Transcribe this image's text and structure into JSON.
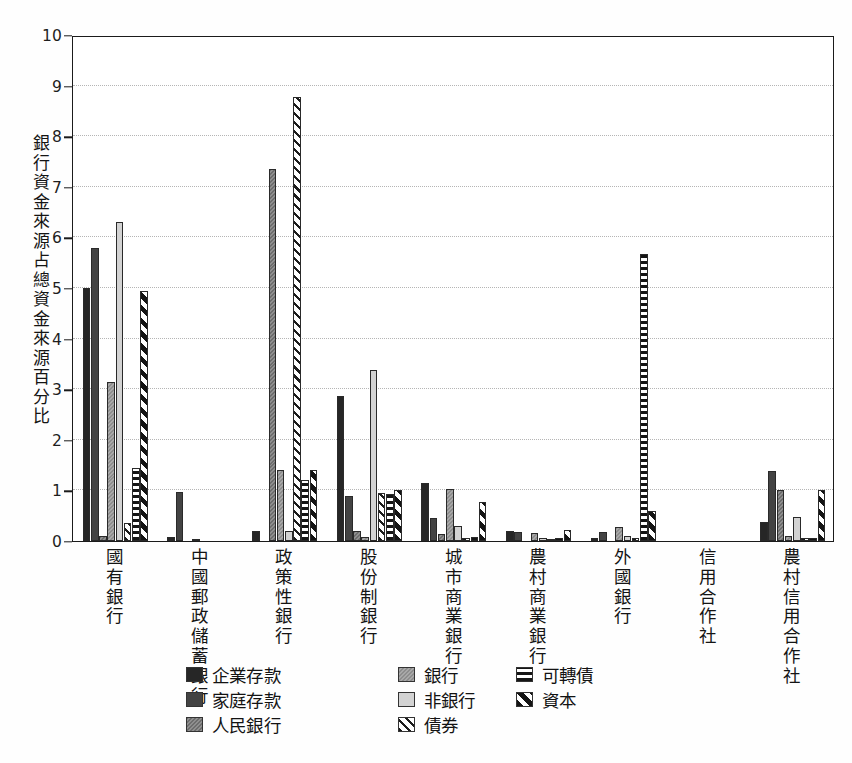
{
  "chart_data": {
    "type": "bar",
    "title": "",
    "xlabel": "",
    "ylabel": "銀行資金來源占總資金來源百分比",
    "ylim": [
      0,
      10
    ],
    "yticks": [
      0,
      1,
      2,
      3,
      4,
      5,
      6,
      7,
      8,
      9,
      10
    ],
    "grid": true,
    "legend_position": "bottom",
    "categories": [
      "國有銀行",
      "中國郵政儲蓄銀行",
      "政策性銀行",
      "股份制銀行",
      "城市商業銀行",
      "農村商業銀行",
      "外國銀行",
      "信用合作社",
      "農村信用合作社"
    ],
    "series": [
      {
        "name": "企業存款",
        "pattern": "solid-black",
        "values": [
          5.0,
          0.08,
          0.2,
          2.87,
          1.15,
          0.2,
          0.05,
          0.0,
          0.38
        ]
      },
      {
        "name": "家庭存款",
        "pattern": "solid-dark",
        "values": [
          5.8,
          0.97,
          0.0,
          0.88,
          0.45,
          0.18,
          0.18,
          0.0,
          1.38
        ]
      },
      {
        "name": "人民銀行",
        "pattern": "dotted-gray",
        "values": [
          0.1,
          0.0,
          7.35,
          0.2,
          0.13,
          0.0,
          0.0,
          0.0,
          1.0
        ]
      },
      {
        "name": "銀行",
        "pattern": "dotted-midgray",
        "values": [
          3.15,
          0.02,
          1.4,
          0.08,
          1.02,
          0.15,
          0.28,
          0.0,
          0.1
        ]
      },
      {
        "name": "非銀行",
        "pattern": "solid-light",
        "values": [
          6.3,
          0.0,
          0.2,
          3.38,
          0.3,
          0.05,
          0.1,
          0.0,
          0.48
        ]
      },
      {
        "name": "債券",
        "pattern": "fine-diagonal",
        "values": [
          0.35,
          0.0,
          8.77,
          0.95,
          0.05,
          0.04,
          0.05,
          0.0,
          0.05
        ]
      },
      {
        "name": "可轉債",
        "pattern": "horizontal",
        "values": [
          1.45,
          0.0,
          1.2,
          0.92,
          0.08,
          0.05,
          5.68,
          0.0,
          0.05
        ]
      },
      {
        "name": "資本",
        "pattern": "bold-diagonal",
        "values": [
          4.95,
          0.0,
          1.4,
          1.0,
          0.78,
          0.22,
          0.6,
          0.0,
          1.0
        ]
      }
    ]
  },
  "legend": {
    "columns": [
      {
        "items": [
          "企業存款",
          "家庭存款",
          "人民銀行"
        ]
      },
      {
        "items": [
          "銀行",
          "非銀行",
          "債券"
        ]
      },
      {
        "items": [
          "可轉債",
          "資本"
        ]
      }
    ]
  },
  "colors": {
    "corp_deposits": "#262626",
    "household_deposits": "#434343",
    "pboc": "#7e7e7e",
    "bank": "#9c9c9c",
    "nonbank": "#d3d3d3",
    "bond": "#1c1c1c",
    "convertible": "#151515",
    "capital": "#141414",
    "axis": "#1b1b1b",
    "grid": "#c9c9c9"
  }
}
